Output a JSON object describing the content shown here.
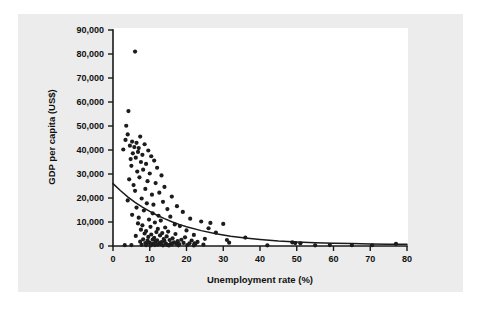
{
  "figure": {
    "background_color": "#ececec",
    "plot_background_color": "#ffffff",
    "point_color": "#1c1c1c",
    "axis_color": "#1a1a1a"
  },
  "chart_data": {
    "type": "scatter",
    "title": "",
    "xlabel": "Unemployment rate (%)",
    "ylabel": "GDP per capita (US$)",
    "xlim": [
      0,
      80
    ],
    "ylim": [
      0,
      90000
    ],
    "xticks": [
      0,
      10,
      20,
      30,
      40,
      50,
      60,
      70,
      80
    ],
    "xtick_labels": [
      "0",
      "10",
      "20",
      "30",
      "40",
      "50",
      "60",
      "70",
      "80"
    ],
    "yticks": [
      0,
      10000,
      20000,
      30000,
      40000,
      50000,
      60000,
      70000,
      80000,
      90000
    ],
    "ytick_labels": [
      "0",
      "10,000",
      "20,000",
      "30,000",
      "40,000",
      "50,000",
      "60,000",
      "70,000",
      "80,000",
      "90,000"
    ],
    "grid": false,
    "legend": null,
    "marker": "circle",
    "marker_size": 2.1,
    "points": [
      [
        6.0,
        81000
      ],
      [
        4.2,
        56200
      ],
      [
        3.6,
        50100
      ],
      [
        4.0,
        46500
      ],
      [
        7.4,
        45600
      ],
      [
        3.4,
        44200
      ],
      [
        5.2,
        43500
      ],
      [
        6.4,
        43000
      ],
      [
        8.6,
        42400
      ],
      [
        4.6,
        41800
      ],
      [
        5.8,
        41200
      ],
      [
        7.0,
        40800
      ],
      [
        2.8,
        40200
      ],
      [
        9.6,
        39800
      ],
      [
        6.8,
        39200
      ],
      [
        5.4,
        38600
      ],
      [
        8.0,
        38000
      ],
      [
        10.4,
        37400
      ],
      [
        6.2,
        36800
      ],
      [
        4.8,
        36200
      ],
      [
        11.2,
        35600
      ],
      [
        7.6,
        35000
      ],
      [
        9.0,
        34200
      ],
      [
        5.0,
        33400
      ],
      [
        12.0,
        32600
      ],
      [
        8.2,
        31800
      ],
      [
        6.6,
        31000
      ],
      [
        10.0,
        30200
      ],
      [
        13.2,
        29400
      ],
      [
        7.2,
        28600
      ],
      [
        4.4,
        27800
      ],
      [
        9.4,
        27000
      ],
      [
        11.6,
        26200
      ],
      [
        5.6,
        25400
      ],
      [
        14.0,
        24600
      ],
      [
        8.8,
        23800
      ],
      [
        6.0,
        23000
      ],
      [
        12.6,
        22200
      ],
      [
        10.6,
        21400
      ],
      [
        16.0,
        20600
      ],
      [
        7.8,
        19800
      ],
      [
        4.0,
        19000
      ],
      [
        13.6,
        18400
      ],
      [
        9.2,
        17800
      ],
      [
        11.0,
        17200
      ],
      [
        17.4,
        16600
      ],
      [
        6.4,
        16000
      ],
      [
        14.8,
        15400
      ],
      [
        8.4,
        14800
      ],
      [
        19.0,
        14200
      ],
      [
        10.8,
        13600
      ],
      [
        5.2,
        13000
      ],
      [
        12.4,
        12600
      ],
      [
        15.6,
        12200
      ],
      [
        7.0,
        11800
      ],
      [
        21.0,
        11400
      ],
      [
        9.8,
        11000
      ],
      [
        13.0,
        10600
      ],
      [
        24.0,
        10200
      ],
      [
        11.4,
        9800
      ],
      [
        6.8,
        9400
      ],
      [
        16.8,
        9000
      ],
      [
        8.0,
        8600
      ],
      [
        18.2,
        8300
      ],
      [
        10.2,
        8000
      ],
      [
        14.2,
        7700
      ],
      [
        26.0,
        7400
      ],
      [
        12.2,
        7100
      ],
      [
        7.6,
        6800
      ],
      [
        20.0,
        6500
      ],
      [
        9.0,
        6200
      ],
      [
        15.0,
        6000
      ],
      [
        11.8,
        5800
      ],
      [
        28.0,
        5600
      ],
      [
        13.4,
        5400
      ],
      [
        8.6,
        5200
      ],
      [
        17.0,
        5000
      ],
      [
        10.4,
        4800
      ],
      [
        22.0,
        4600
      ],
      [
        12.8,
        4400
      ],
      [
        6.2,
        4200
      ],
      [
        14.6,
        4000
      ],
      [
        9.6,
        3800
      ],
      [
        19.6,
        3600
      ],
      [
        11.2,
        3400
      ],
      [
        16.2,
        3200
      ],
      [
        25.0,
        3000
      ],
      [
        13.8,
        2900
      ],
      [
        8.2,
        2800
      ],
      [
        10.8,
        2700
      ],
      [
        18.6,
        2600
      ],
      [
        15.4,
        2500
      ],
      [
        12.0,
        2400
      ],
      [
        21.4,
        2300
      ],
      [
        9.4,
        2200
      ],
      [
        14.0,
        2100
      ],
      [
        17.6,
        2000
      ],
      [
        11.6,
        1900
      ],
      [
        7.4,
        1800
      ],
      [
        23.0,
        1700
      ],
      [
        13.2,
        1600
      ],
      [
        16.6,
        1500
      ],
      [
        10.0,
        1400
      ],
      [
        19.2,
        1300
      ],
      [
        12.6,
        1250
      ],
      [
        8.8,
        1200
      ],
      [
        15.8,
        1150
      ],
      [
        20.8,
        1100
      ],
      [
        11.0,
        1050
      ],
      [
        14.4,
        1000
      ],
      [
        17.2,
        950
      ],
      [
        9.2,
        900
      ],
      [
        22.4,
        850
      ],
      [
        13.0,
        800
      ],
      [
        18.0,
        750
      ],
      [
        10.6,
        700
      ],
      [
        16.0,
        650
      ],
      [
        12.2,
        600
      ],
      [
        24.6,
        550
      ],
      [
        7.8,
        500
      ],
      [
        14.8,
        450
      ],
      [
        20.2,
        420
      ],
      [
        11.4,
        400
      ],
      [
        5.0,
        380
      ],
      [
        3.2,
        350
      ],
      [
        9.0,
        320
      ],
      [
        17.8,
        300
      ],
      [
        13.6,
        280
      ],
      [
        22.0,
        260
      ],
      [
        15.2,
        240
      ],
      [
        10.2,
        220
      ],
      [
        26.5,
        9600
      ],
      [
        30.0,
        9200
      ],
      [
        31.0,
        2500
      ],
      [
        31.6,
        1400
      ],
      [
        22.2,
        1100
      ],
      [
        36.0,
        3500
      ],
      [
        48.8,
        1500
      ],
      [
        49.6,
        1200
      ],
      [
        51.0,
        1100
      ],
      [
        77.0,
        900
      ],
      [
        59.0,
        400
      ],
      [
        65.0,
        350
      ],
      [
        70.5,
        320
      ],
      [
        42.0,
        300
      ],
      [
        55.0,
        280
      ]
    ],
    "fit_curve": {
      "type": "exponential_decay",
      "description": "Fitted exponential trend line through scatter",
      "start": [
        0,
        26000
      ],
      "end": [
        80,
        700
      ],
      "points": [
        [
          0,
          26000
        ],
        [
          2,
          23100
        ],
        [
          4,
          20500
        ],
        [
          6,
          18200
        ],
        [
          8,
          16200
        ],
        [
          10,
          14400
        ],
        [
          12,
          12800
        ],
        [
          14,
          11400
        ],
        [
          16,
          10100
        ],
        [
          18,
          9000
        ],
        [
          20,
          8000
        ],
        [
          24,
          6400
        ],
        [
          28,
          5100
        ],
        [
          32,
          4100
        ],
        [
          36,
          3300
        ],
        [
          40,
          2700
        ],
        [
          45,
          2100
        ],
        [
          50,
          1700
        ],
        [
          55,
          1400
        ],
        [
          60,
          1150
        ],
        [
          65,
          1000
        ],
        [
          70,
          880
        ],
        [
          75,
          780
        ],
        [
          80,
          700
        ]
      ]
    }
  }
}
